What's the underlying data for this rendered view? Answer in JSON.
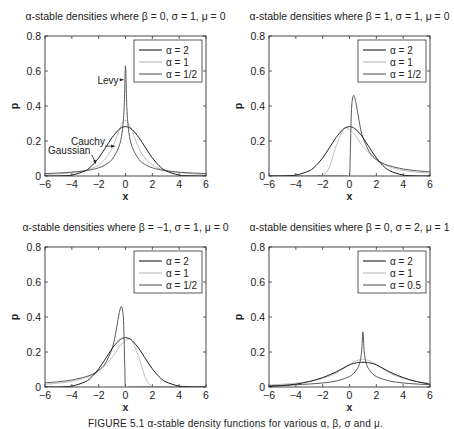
{
  "chart_data": [
    {
      "type": "line",
      "title": "α-stable densities where β = 0, σ = 1, μ = 0",
      "xlabel": "x",
      "ylabel": "p",
      "xlim": [
        -6,
        6
      ],
      "ylim": [
        0,
        0.8
      ],
      "xticks": [
        -6,
        -4,
        -2,
        0,
        2,
        4,
        6
      ],
      "yticks": [
        0,
        0.2,
        0.4,
        0.6,
        0.8
      ],
      "ytick_labels": [
        "0",
        "0.2",
        "0.4",
        "0.6",
        "0.8"
      ],
      "grid": false,
      "legend_position": "upper right",
      "legend": [
        "α = 2",
        "α = 1",
        "α = 1/2"
      ],
      "annotations": [
        {
          "text": "Levy",
          "x": -1.3,
          "y": 0.55,
          "arrow_to": [
            -0.15,
            0.55
          ]
        },
        {
          "text": "Cauchy",
          "x": -2.8,
          "y": 0.2,
          "arrow_to": [
            -0.8,
            0.17
          ]
        },
        {
          "text": "Gaussian",
          "x": -4.2,
          "y": 0.15,
          "arrow_to": [
            -2.2,
            0.07
          ]
        }
      ],
      "x": [
        -6,
        -5,
        -4,
        -3,
        -2.5,
        -2,
        -1.5,
        -1,
        -0.5,
        -0.25,
        -0.1,
        0,
        0.1,
        0.25,
        0.5,
        1,
        1.5,
        2,
        2.5,
        3,
        4,
        5,
        6
      ],
      "series": [
        {
          "name": "α = 2",
          "values": [
            0.0,
            0.0005,
            0.0052,
            0.0297,
            0.0592,
            0.1038,
            0.1607,
            0.2197,
            0.265,
            0.2777,
            0.2814,
            0.2821,
            0.2814,
            0.2777,
            0.265,
            0.2197,
            0.1607,
            0.1038,
            0.0592,
            0.0297,
            0.0052,
            0.0005,
            0.0
          ]
        },
        {
          "name": "α = 1",
          "values": [
            0.0086,
            0.0122,
            0.0187,
            0.0318,
            0.0439,
            0.0637,
            0.0979,
            0.1592,
            0.2546,
            0.2996,
            0.3152,
            0.3183,
            0.3152,
            0.2996,
            0.2546,
            0.1592,
            0.0979,
            0.0637,
            0.0439,
            0.0318,
            0.0187,
            0.0122,
            0.0086
          ]
        },
        {
          "name": "α = 1/2",
          "values": [
            0.014,
            0.017,
            0.022,
            0.03,
            0.037,
            0.047,
            0.064,
            0.095,
            0.165,
            0.25,
            0.39,
            0.63,
            0.39,
            0.25,
            0.165,
            0.095,
            0.064,
            0.047,
            0.037,
            0.03,
            0.022,
            0.017,
            0.014
          ]
        }
      ]
    },
    {
      "type": "line",
      "title": "α-stable densities where β = 1, σ = 1, μ = 0",
      "xlabel": "x",
      "ylabel": "p",
      "xlim": [
        -6,
        6
      ],
      "ylim": [
        0,
        0.8
      ],
      "xticks": [
        -6,
        -4,
        -2,
        0,
        2,
        4,
        6
      ],
      "yticks": [
        0,
        0.2,
        0.4,
        0.6,
        0.8
      ],
      "ytick_labels": [
        "0",
        "0.2",
        "0.4",
        "0.6",
        "0.8"
      ],
      "grid": false,
      "legend_position": "upper right",
      "legend": [
        "α = 2",
        "α = 1",
        "α = 1/2"
      ],
      "x": [
        -6,
        -5,
        -4,
        -3,
        -2.5,
        -2,
        -1.5,
        -1,
        -0.5,
        -0.25,
        0,
        0.05,
        0.15,
        0.3,
        0.5,
        0.75,
        1,
        1.5,
        2,
        2.5,
        3,
        4,
        5,
        6
      ],
      "series": [
        {
          "name": "α = 2",
          "values": [
            0.0,
            0.0005,
            0.0052,
            0.0297,
            0.0592,
            0.1038,
            0.1607,
            0.2197,
            0.265,
            0.2777,
            0.2821,
            0.2819,
            0.2805,
            0.2759,
            0.265,
            0.2442,
            0.2197,
            0.1607,
            0.1038,
            0.0592,
            0.0297,
            0.0052,
            0.0005,
            0.0
          ]
        },
        {
          "name": "α = 1",
          "values": [
            0.0,
            0.0,
            0.0,
            0.0,
            0.0,
            0.0,
            0.05,
            0.17,
            0.26,
            0.275,
            0.265,
            0.262,
            0.256,
            0.245,
            0.225,
            0.195,
            0.17,
            0.125,
            0.09,
            0.068,
            0.052,
            0.032,
            0.022,
            0.016
          ]
        },
        {
          "name": "α = 1/2",
          "values": [
            0.0,
            0.0,
            0.0,
            0.0,
            0.0,
            0.0,
            0.0,
            0.0,
            0.0,
            0.0,
            0.0,
            0.1,
            0.38,
            0.46,
            0.41,
            0.3,
            0.22,
            0.135,
            0.095,
            0.072,
            0.058,
            0.04,
            0.03,
            0.024
          ]
        }
      ]
    },
    {
      "type": "line",
      "title": "α-stable densities where β = −1, σ = 1, μ = 0",
      "xlabel": "x",
      "ylabel": "p",
      "xlim": [
        -6,
        6
      ],
      "ylim": [
        0,
        0.8
      ],
      "xticks": [
        -6,
        -4,
        -2,
        0,
        2,
        4,
        6
      ],
      "yticks": [
        0,
        0.2,
        0.4,
        0.6,
        0.8
      ],
      "ytick_labels": [
        "0",
        "0.2",
        "0.4",
        "0.6",
        "0.8"
      ],
      "grid": false,
      "legend_position": "upper right",
      "legend": [
        "α = 2",
        "α = 1",
        "α = 1/2"
      ],
      "x": [
        -6,
        -5,
        -4,
        -3,
        -2.5,
        -2,
        -1.5,
        -1,
        -0.75,
        -0.5,
        -0.3,
        -0.15,
        -0.05,
        0,
        0.25,
        0.5,
        1,
        1.5,
        2,
        2.5,
        3,
        4,
        5,
        6
      ],
      "series": [
        {
          "name": "α = 2",
          "values": [
            0.0,
            0.0005,
            0.0052,
            0.0297,
            0.0592,
            0.1038,
            0.1607,
            0.2197,
            0.2442,
            0.265,
            0.2759,
            0.2805,
            0.2819,
            0.2821,
            0.2777,
            0.265,
            0.2197,
            0.1607,
            0.1038,
            0.0592,
            0.0297,
            0.0052,
            0.0005,
            0.0
          ]
        },
        {
          "name": "α = 1",
          "values": [
            0.016,
            0.022,
            0.032,
            0.052,
            0.068,
            0.09,
            0.125,
            0.17,
            0.195,
            0.225,
            0.245,
            0.256,
            0.262,
            0.265,
            0.275,
            0.26,
            0.17,
            0.05,
            0.0,
            0.0,
            0.0,
            0.0,
            0.0,
            0.0
          ]
        },
        {
          "name": "α = 1/2",
          "values": [
            0.024,
            0.03,
            0.04,
            0.058,
            0.072,
            0.095,
            0.135,
            0.22,
            0.3,
            0.41,
            0.46,
            0.38,
            0.1,
            0.0,
            0.0,
            0.0,
            0.0,
            0.0,
            0.0,
            0.0,
            0.0,
            0.0,
            0.0,
            0.0
          ]
        }
      ]
    },
    {
      "type": "line",
      "title": "α-stable densities where β = 0, σ = 2, μ = 1",
      "xlabel": "x",
      "ylabel": "p",
      "xlim": [
        -6,
        6
      ],
      "ylim": [
        0,
        0.8
      ],
      "xticks": [
        -6,
        -4,
        -2,
        0,
        2,
        4,
        6
      ],
      "yticks": [
        0,
        0.2,
        0.4,
        0.6,
        0.8
      ],
      "ytick_labels": [
        "0",
        "0.2",
        "0.4",
        "0.6",
        "0.8"
      ],
      "grid": false,
      "legend_position": "upper right",
      "legend": [
        "α = 2",
        "α = 1",
        "α = 0.5"
      ],
      "x": [
        -6,
        -5,
        -4,
        -3,
        -2,
        -1,
        0,
        0.5,
        0.75,
        0.9,
        1,
        1.1,
        1.25,
        1.5,
        2,
        3,
        4,
        5,
        6
      ],
      "series": [
        {
          "name": "α = 2",
          "values": [
            0.0033,
            0.0079,
            0.0164,
            0.0311,
            0.0538,
            0.086,
            0.1269,
            0.1375,
            0.1405,
            0.1409,
            0.141,
            0.1409,
            0.1405,
            0.1375,
            0.1269,
            0.086,
            0.0538,
            0.0311,
            0.0164
          ]
        },
        {
          "name": "α = 1",
          "values": [
            0.0119,
            0.0159,
            0.0219,
            0.0318,
            0.049,
            0.0796,
            0.1273,
            0.1498,
            0.1554,
            0.1588,
            0.1592,
            0.1588,
            0.1554,
            0.1498,
            0.1273,
            0.0796,
            0.049,
            0.0318,
            0.0219
          ]
        },
        {
          "name": "α = 0.5",
          "values": [
            0.008,
            0.01,
            0.013,
            0.017,
            0.023,
            0.034,
            0.06,
            0.095,
            0.135,
            0.2,
            0.315,
            0.2,
            0.135,
            0.095,
            0.06,
            0.034,
            0.023,
            0.017,
            0.013
          ]
        }
      ]
    }
  ],
  "styles": {
    "series_colors": [
      "#1e1e1e",
      "#b8b8b8",
      "#5a5a5a"
    ],
    "axis_color": "#333333",
    "text_color": "#222222"
  },
  "caption": "FIGURE 5.1   α-stable density functions for various α, β, σ and μ."
}
